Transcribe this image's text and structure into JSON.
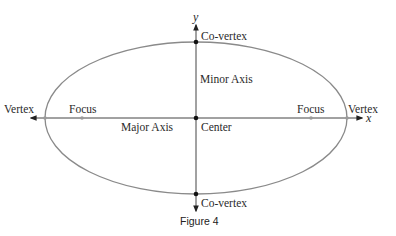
{
  "figure": {
    "caption": "Figure 4",
    "type": "ellipse-diagram"
  },
  "axes": {
    "x_label": "x",
    "y_label": "y"
  },
  "ellipse": {
    "center": [
      196,
      118
    ],
    "semi_major": 151,
    "semi_minor": 76,
    "stroke_color": "#8a8a8a"
  },
  "labels": {
    "vertex_left": "Vertex",
    "vertex_right": "Vertex",
    "focus_left": "Focus",
    "focus_right": "Focus",
    "co_vertex_top": "Co-vertex",
    "co_vertex_bottom": "Co-vertex",
    "minor_axis": "Minor Axis",
    "major_axis": "Major Axis",
    "center": "Center"
  },
  "colors": {
    "axis": "#333333",
    "ellipse": "#8a8a8a",
    "point": "#111111",
    "focus_point": "#9a9a9a"
  }
}
